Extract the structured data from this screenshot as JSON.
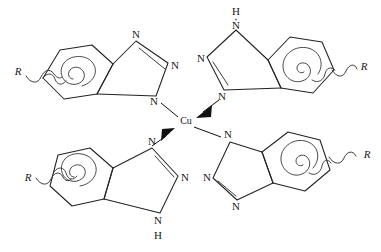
{
  "figure": {
    "kind": "chemical-structure",
    "background_color": "#ffffff",
    "line_color": "#222222"
  },
  "center": {
    "metal_label": "Cu",
    "x": 186,
    "y": 122
  },
  "ligands": [
    {
      "id": "top-left",
      "quadrant": "top-left",
      "r_group_label": "R",
      "bond_to_metal": "plain",
      "nitrogen_labels": [
        "N",
        "N",
        "N"
      ],
      "nh_label": null,
      "nh_hydrogen": null
    },
    {
      "id": "top-right",
      "quadrant": "top-right",
      "r_group_label": "R",
      "bond_to_metal": "dative-arrow",
      "nitrogen_labels": [
        "N",
        "N",
        "N"
      ],
      "nh_label": "N",
      "nh_hydrogen": "H"
    },
    {
      "id": "bottom-left",
      "quadrant": "bottom-left",
      "r_group_label": "R",
      "bond_to_metal": "dative-arrow",
      "nitrogen_labels": [
        "N",
        "N",
        "N"
      ],
      "nh_label": "N",
      "nh_hydrogen": "H"
    },
    {
      "id": "bottom-right",
      "quadrant": "bottom-right",
      "r_group_label": "R",
      "bond_to_metal": "plain",
      "nitrogen_labels": [
        "N",
        "N",
        "N"
      ],
      "nh_label": null,
      "nh_hydrogen": null
    }
  ],
  "labels": {
    "tl_n_top": "N",
    "tl_n_right": "N",
    "tl_n_bottom": "N",
    "tl_r": "R",
    "tr_h_top": "H",
    "tr_n_top": "N",
    "tr_n_left": "N",
    "tr_n_bottom": "N",
    "tr_r": "R",
    "bl_n_top": "N",
    "bl_n_right": "N",
    "bl_n_bottom": "N",
    "bl_h_bottom": "H",
    "bl_r": "R",
    "br_n_top": "N",
    "br_n_left": "N",
    "br_n_bottom": "N",
    "br_r": "R"
  }
}
